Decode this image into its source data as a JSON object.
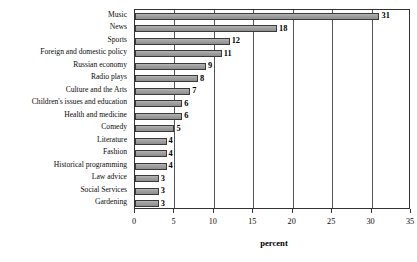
{
  "chart_data": {
    "type": "bar",
    "orientation": "horizontal",
    "title": "",
    "subtitle": "",
    "xlabel": "percent",
    "ylabel": "",
    "xlim": [
      0,
      35
    ],
    "xticks": [
      0,
      5,
      10,
      15,
      20,
      25,
      30,
      35
    ],
    "xtick_labels": [
      "0",
      "5",
      "10",
      "15",
      "20",
      "25",
      "30",
      "35"
    ],
    "grid": "vertical",
    "legend": "none",
    "bar_color": "#9a9a9a",
    "bar_edge_color": "#3a3a3a",
    "show_data_labels": true,
    "categories": [
      "Music",
      "News",
      "Sports",
      "Foreign and domestic policy",
      "Russian economy",
      "Radio plays",
      "Culture and the Arts",
      "Children's issues and education",
      "Health and medicine",
      "Comedy",
      "Literature",
      "Fashion",
      "Historical programming",
      "Law advice",
      "Social Services",
      "Gardening"
    ],
    "values": [
      31,
      18,
      12,
      11,
      9,
      8,
      7,
      6,
      6,
      5,
      4,
      4,
      4,
      3,
      3,
      3
    ],
    "value_labels": [
      "31",
      "18",
      "12",
      "11",
      "9",
      "8",
      "7",
      "6",
      "6",
      "5",
      "4",
      "4",
      "4",
      "3",
      "3",
      "3"
    ]
  }
}
